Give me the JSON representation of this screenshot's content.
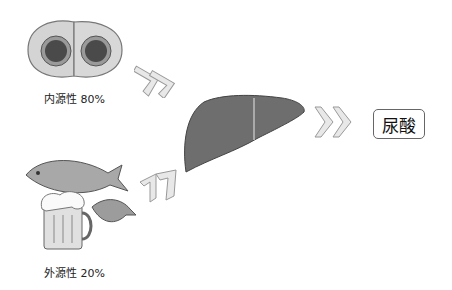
{
  "diagram": {
    "sources": [
      {
        "id": "endogenous",
        "label": "内源性 80%",
        "image": "cells"
      },
      {
        "id": "exogenous",
        "label": "外源性 20%",
        "image": "fish-shrimp-beer"
      }
    ],
    "organ": "liver",
    "result": {
      "label": "尿酸"
    },
    "arrows": [
      {
        "from": "endogenous",
        "to": "liver",
        "icon": "double-chevron-icon"
      },
      {
        "from": "exogenous",
        "to": "liver",
        "icon": "double-chevron-icon"
      },
      {
        "from": "liver",
        "to": "result",
        "icon": "double-chevron-icon"
      }
    ],
    "colors": {
      "cell_outer": "#c9c9c9",
      "cell_nucleus": "#4a4a4a",
      "liver": "#6e6e6e",
      "arrow_fill": "#e8e8e8",
      "arrow_stroke": "#999999"
    }
  }
}
